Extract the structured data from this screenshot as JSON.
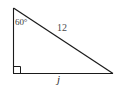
{
  "figure": {
    "kind": "right-triangle-diagram",
    "background_color": "#ffffff",
    "stroke_color": "#1a1a1a",
    "label_color": "#3a3a3a",
    "width": 119,
    "height": 88,
    "vertices": {
      "top_left": [
        13,
        8
      ],
      "bottom_left": [
        13,
        73
      ],
      "bottom_right": [
        113,
        73
      ]
    },
    "right_angle_marker": {
      "at": "bottom_left",
      "size": 7
    },
    "labels": {
      "angle": "60°",
      "hypotenuse": "12",
      "base": "j"
    }
  }
}
